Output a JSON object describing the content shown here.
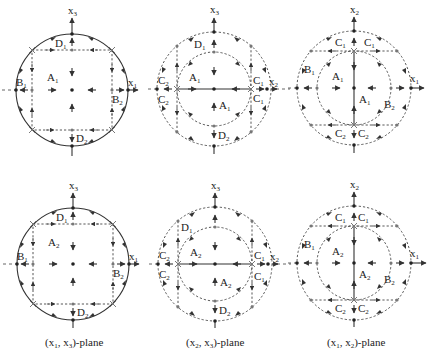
{
  "figure": {
    "rows": [
      {
        "row": "top",
        "panels": [
          {
            "id": "p1-top",
            "plane": "(x1, x3)",
            "axes": {
              "horizontal": "x",
              "horizontal_sub": "1",
              "vertical": "x",
              "vertical_sub": "3"
            },
            "regions": [
              {
                "name": "A",
                "sub": "1"
              },
              {
                "name": "B",
                "sub": "1"
              },
              {
                "name": "B",
                "sub": "2"
              },
              {
                "name": "D",
                "sub": "1"
              },
              {
                "name": "D",
                "sub": "2"
              }
            ]
          },
          {
            "id": "p2-top",
            "plane": "(x2, x3)",
            "axes": {
              "horizontal": "x",
              "horizontal_sub": "2",
              "vertical": "x",
              "vertical_sub": "3"
            },
            "regions": [
              {
                "name": "A",
                "sub": "1"
              },
              {
                "name": "A",
                "sub": "1"
              },
              {
                "name": "C",
                "sub": "1"
              },
              {
                "name": "C",
                "sub": "1"
              },
              {
                "name": "C",
                "sub": "2"
              },
              {
                "name": "C",
                "sub": "2"
              },
              {
                "name": "D",
                "sub": "1"
              },
              {
                "name": "D",
                "sub": "2"
              }
            ]
          },
          {
            "id": "p3-top",
            "plane": "(x1, x2)",
            "axes": {
              "horizontal": "x",
              "horizontal_sub": "1",
              "vertical": "x",
              "vertical_sub": "2"
            },
            "regions": [
              {
                "name": "A",
                "sub": "1"
              },
              {
                "name": "A",
                "sub": "1"
              },
              {
                "name": "B",
                "sub": "1"
              },
              {
                "name": "B",
                "sub": "2"
              },
              {
                "name": "C",
                "sub": "1"
              },
              {
                "name": "C",
                "sub": "1"
              },
              {
                "name": "C",
                "sub": "2"
              },
              {
                "name": "C",
                "sub": "2"
              }
            ]
          }
        ]
      },
      {
        "row": "bottom",
        "panels": [
          {
            "id": "p1-bottom",
            "plane": "(x1, x3)",
            "axes": {
              "horizontal": "x",
              "horizontal_sub": "1",
              "vertical": "x",
              "vertical_sub": "3"
            },
            "regions": [
              {
                "name": "A",
                "sub": "2"
              },
              {
                "name": "B",
                "sub": "1"
              },
              {
                "name": "B",
                "sub": "2"
              },
              {
                "name": "D",
                "sub": "1"
              },
              {
                "name": "D",
                "sub": "2"
              }
            ]
          },
          {
            "id": "p2-bottom",
            "plane": "(x2, x3)",
            "axes": {
              "horizontal": "x",
              "horizontal_sub": "2",
              "vertical": "x",
              "vertical_sub": "3"
            },
            "regions": [
              {
                "name": "A",
                "sub": "2"
              },
              {
                "name": "A",
                "sub": "2"
              },
              {
                "name": "C",
                "sub": "1"
              },
              {
                "name": "C",
                "sub": "1"
              },
              {
                "name": "C",
                "sub": "2"
              },
              {
                "name": "C",
                "sub": "2"
              },
              {
                "name": "D",
                "sub": "1"
              },
              {
                "name": "D",
                "sub": "2"
              }
            ]
          },
          {
            "id": "p3-bottom",
            "plane": "(x1, x2)",
            "axes": {
              "horizontal": "x",
              "horizontal_sub": "1",
              "vertical": "x",
              "vertical_sub": "2"
            },
            "regions": [
              {
                "name": "A",
                "sub": "2"
              },
              {
                "name": "A",
                "sub": "2"
              },
              {
                "name": "B",
                "sub": "1"
              },
              {
                "name": "B",
                "sub": "2"
              },
              {
                "name": "C",
                "sub": "1"
              },
              {
                "name": "C",
                "sub": "1"
              },
              {
                "name": "C",
                "sub": "2"
              },
              {
                "name": "C",
                "sub": "2"
              }
            ]
          }
        ]
      }
    ],
    "captions": [
      "(x1, x3)-plane",
      "(x2, x3)-plane",
      "(x1, x2)-plane"
    ],
    "caption_parts": [
      {
        "open": "(x",
        "s1": "1",
        "mid": ", x",
        "s2": "3",
        "close": ")-plane"
      },
      {
        "open": "(x",
        "s1": "2",
        "mid": ", x",
        "s2": "3",
        "close": ")-plane"
      },
      {
        "open": "(x",
        "s1": "1",
        "mid": ", x",
        "s2": "2",
        "close": ")-plane"
      }
    ]
  }
}
